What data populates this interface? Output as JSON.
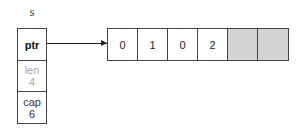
{
  "diagram": {
    "variable_name": "s",
    "struct": {
      "fields": [
        {
          "label": "ptr",
          "value": ""
        },
        {
          "label": "len",
          "value": "4"
        },
        {
          "label": "cap",
          "value": "6"
        }
      ]
    },
    "array": {
      "cells": [
        "0",
        "1",
        "0",
        "2",
        "",
        ""
      ],
      "filled_color": "#ffffff",
      "empty_color": "#d4d4d4"
    }
  }
}
